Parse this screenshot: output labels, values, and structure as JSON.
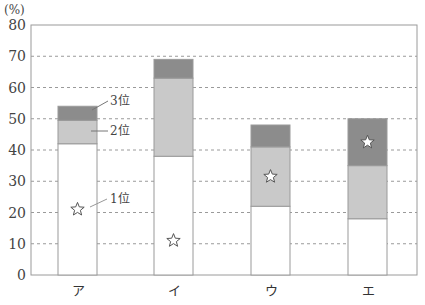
{
  "chart_data": {
    "type": "bar",
    "stacked": true,
    "title": "",
    "xlabel": "",
    "ylabel": "(%)",
    "ylim": [
      0,
      80
    ],
    "yticks": [
      0,
      10,
      20,
      30,
      40,
      50,
      60,
      70,
      80
    ],
    "grid": "horizontal dashed",
    "categories": [
      "ア",
      "イ",
      "ウ",
      "エ"
    ],
    "series": [
      {
        "name": "1位",
        "values": [
          42,
          38,
          22,
          18
        ],
        "color": "#ffffff"
      },
      {
        "name": "2位",
        "values": [
          7.5,
          25,
          19,
          17
        ],
        "color": "#c9c9c9"
      },
      {
        "name": "3位",
        "values": [
          4.5,
          6,
          7,
          15
        ],
        "color": "#8c8c8c"
      }
    ],
    "totals": [
      54,
      69,
      48,
      50
    ],
    "star_markers": [
      {
        "category": "ア",
        "segment": "1位"
      },
      {
        "category": "イ",
        "segment": "1位"
      },
      {
        "category": "ウ",
        "segment": "2位"
      },
      {
        "category": "エ",
        "segment": "3位"
      }
    ],
    "annotations": [
      "3位",
      "2位",
      "1位"
    ]
  },
  "labels": {
    "unit": "(%)",
    "rank3": "3位",
    "rank2": "2位",
    "rank1": "1位",
    "cat0": "ア",
    "cat1": "イ",
    "cat2": "ウ",
    "cat3": "エ"
  }
}
